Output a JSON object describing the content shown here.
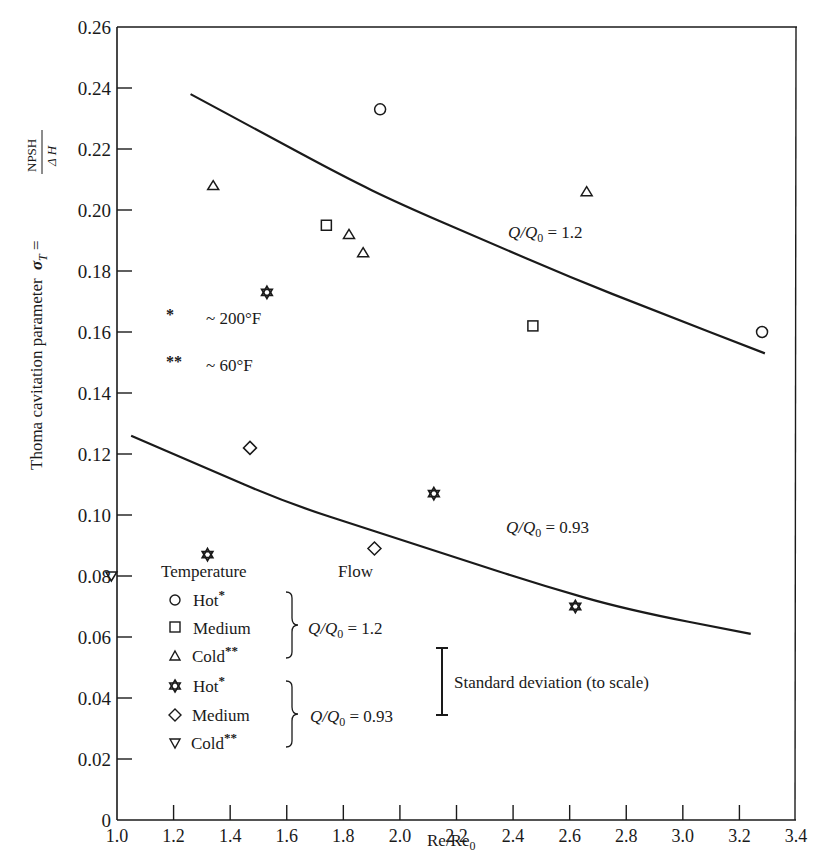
{
  "chart_data": {
    "type": "scatter",
    "title": "",
    "xlabel": "Re/Re0",
    "ylabel": "Thoma cavitation parameter σT = NPSH / ΔH",
    "xlim": [
      1.0,
      3.4
    ],
    "ylim": [
      0,
      0.26
    ],
    "grid": false,
    "x_ticks": [
      "1.0",
      "1.2",
      "1.4",
      "1.6",
      "1.8",
      "2.0",
      "2.2",
      "2.4",
      "2.6",
      "2.8",
      "3.0",
      "3.2",
      "3.4"
    ],
    "y_ticks": [
      "0",
      "0.02",
      "0.04",
      "0.06",
      "0.08",
      "0.10",
      "0.12",
      "0.14",
      "0.16",
      "0.18",
      "0.20",
      "0.22",
      "0.24",
      "0.26"
    ],
    "series": [
      {
        "name": "Hot* (Q/Q0 = 1.2)",
        "marker": "circle",
        "points": [
          [
            1.93,
            0.233
          ],
          [
            3.28,
            0.16
          ]
        ]
      },
      {
        "name": "Medium (Q/Q0 = 1.2)",
        "marker": "square",
        "points": [
          [
            1.74,
            0.195
          ],
          [
            2.47,
            0.162
          ]
        ]
      },
      {
        "name": "Cold** (Q/Q0 = 1.2)",
        "marker": "triangle-up",
        "points": [
          [
            1.34,
            0.208
          ],
          [
            1.82,
            0.192
          ],
          [
            1.87,
            0.186
          ],
          [
            2.66,
            0.206
          ]
        ]
      },
      {
        "name": "Hot* (Q/Q0 = 0.93)",
        "marker": "star",
        "points": [
          [
            1.53,
            0.173
          ],
          [
            1.32,
            0.087
          ],
          [
            2.12,
            0.107
          ],
          [
            2.62,
            0.07
          ]
        ]
      },
      {
        "name": "Medium (Q/Q0 = 0.93)",
        "marker": "diamond",
        "points": [
          [
            1.47,
            0.122
          ],
          [
            1.91,
            0.089
          ]
        ]
      },
      {
        "name": "Cold** (Q/Q0 = 0.93)",
        "marker": "triangle-down",
        "points": [
          [
            0.98,
            0.08
          ]
        ]
      }
    ],
    "curves": [
      {
        "name": "Q/Q0 = 1.2",
        "points": [
          [
            1.26,
            0.238
          ],
          [
            1.5,
            0.226
          ],
          [
            1.8,
            0.211
          ],
          [
            2.0,
            0.202
          ],
          [
            2.3,
            0.19
          ],
          [
            2.6,
            0.178
          ],
          [
            2.9,
            0.167
          ],
          [
            3.29,
            0.153
          ]
        ]
      },
      {
        "name": "Q/Q0 = 0.93",
        "points": [
          [
            1.05,
            0.126
          ],
          [
            1.3,
            0.116
          ],
          [
            1.6,
            0.104
          ],
          [
            1.9,
            0.095
          ],
          [
            2.2,
            0.086
          ],
          [
            2.5,
            0.077
          ],
          [
            2.8,
            0.069
          ],
          [
            3.24,
            0.061
          ]
        ]
      }
    ],
    "annotations": [
      {
        "text": "Q/Q0 = 1.2",
        "x": 2.55,
        "y": 0.185
      },
      {
        "text": "Q/Q0 = 0.93",
        "x": 2.55,
        "y": 0.085
      },
      {
        "text": "* ~ 200°F",
        "x": 1.1,
        "y": 0.158
      },
      {
        "text": "** ~ 60°F",
        "x": 1.1,
        "y": 0.142
      },
      {
        "text": "Standard deviation (to scale)",
        "x": 2.2,
        "y": 0.032,
        "bar_range": [
          0.02,
          0.044
        ]
      }
    ],
    "legend": {
      "position": "lower-left",
      "headers": [
        "Temperature",
        "Flow"
      ],
      "groups": [
        {
          "flow": "Q/Q0 = 1.2",
          "items": [
            "Hot*",
            "Medium",
            "Cold**"
          ]
        },
        {
          "flow": "Q/Q0 = 0.93",
          "items": [
            "Hot*",
            "Medium",
            "Cold**"
          ]
        }
      ]
    }
  },
  "labels": {
    "y_axis_main": "Thoma cavitation parameter",
    "y_axis_sym": "σ",
    "y_axis_sub": "T",
    "y_axis_eq": " =",
    "y_frac_num": "NPSH",
    "y_frac_den": "Δ H",
    "x_axis_main": "Re/Re",
    "x_axis_sub": "0",
    "curve_hi_a": "Q/Q",
    "curve_hi_sub": "0",
    "curve_hi_b": " = 1.2",
    "curve_lo_a": "Q/Q",
    "curve_lo_sub": "0",
    "curve_lo_b": " = 0.93",
    "note_star1": "*",
    "note_star1_text": "~ 200°F",
    "note_star2": "**",
    "note_star2_text": "~ 60°F",
    "legend_temp_header": "Temperature",
    "legend_flow_header": "Flow",
    "legend_hot": "Hot",
    "legend_medium": "Medium",
    "legend_cold": "Cold",
    "legend_star1": "*",
    "legend_star2": "**",
    "legend_flow1_a": "Q/Q",
    "legend_flow1_sub": "0",
    "legend_flow1_b": " = 1.2",
    "legend_flow2_a": "Q/Q",
    "legend_flow2_sub": "0",
    "legend_flow2_b": " = 0.93",
    "std_dev_label": "Standard deviation (to scale)",
    "caption": "Figure 8.21 Thoma cavitation parameter versus normalized Reynolds number (partially cut off)"
  }
}
